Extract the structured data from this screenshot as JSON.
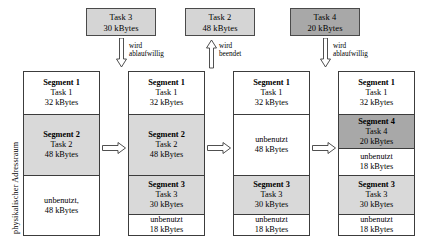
{
  "diagram": {
    "axis_caption": "physikalischer Adressraum",
    "events": [
      {
        "name": "task3-arrives",
        "line1": "Task 3",
        "line2": "30 kBytes",
        "fill": "light",
        "arrow_direction": "down",
        "arrow_label_line1": "wird",
        "arrow_label_line2": "ablaufwillig"
      },
      {
        "name": "task2-terminates",
        "line1": "Task 2",
        "line2": "48 kBytes",
        "fill": "light",
        "arrow_direction": "up",
        "arrow_label_line1": "wird",
        "arrow_label_line2": "beendet"
      },
      {
        "name": "task4-arrives",
        "line1": "Task 4",
        "line2": "20 kBytes",
        "fill": "dark",
        "arrow_direction": "down",
        "arrow_label_line1": "wird",
        "arrow_label_line2": "ablaufwillig"
      }
    ],
    "transition_arrows": [
      {
        "name": "transition-1-to-2",
        "direction": "right"
      },
      {
        "name": "transition-2-to-3",
        "direction": "right"
      },
      {
        "name": "transition-3-to-4",
        "direction": "right"
      }
    ],
    "columns": [
      {
        "name": "memory-state-1",
        "blocks": [
          {
            "title": "Segment 1",
            "line1": "Task 1",
            "line2": "32 kBytes",
            "fill": "white",
            "size_kb": 32
          },
          {
            "title": "Segment 2",
            "line1": "Task 2",
            "line2": "48 kBytes",
            "fill": "light",
            "size_kb": 48
          },
          {
            "title": "",
            "line1": "unbenutzt,",
            "line2": "48 kBytes",
            "fill": "white",
            "size_kb": 48
          }
        ]
      },
      {
        "name": "memory-state-2",
        "blocks": [
          {
            "title": "Segment 1",
            "line1": "Task 1",
            "line2": "32 kBytes",
            "fill": "white",
            "size_kb": 32
          },
          {
            "title": "Segment 2",
            "line1": "Task 2",
            "line2": "48 kBytes",
            "fill": "light",
            "size_kb": 48
          },
          {
            "title": "Segment 3",
            "line1": "Task 3",
            "line2": "30 kBytes",
            "fill": "light",
            "size_kb": 30
          },
          {
            "title": "",
            "line1": "unbenutzt",
            "line2": "18 kBytes",
            "fill": "white",
            "size_kb": 18
          }
        ]
      },
      {
        "name": "memory-state-3",
        "blocks": [
          {
            "title": "Segment 1",
            "line1": "Task 1",
            "line2": "32 kBytes",
            "fill": "white",
            "size_kb": 32
          },
          {
            "title": "",
            "line1": "unbenutzt",
            "line2": "48 kBytes",
            "fill": "white",
            "size_kb": 48
          },
          {
            "title": "Segment 3",
            "line1": "Task 3",
            "line2": "30 kBytes",
            "fill": "light",
            "size_kb": 30
          },
          {
            "title": "",
            "line1": "unbenutzt",
            "line2": "18 kBytes",
            "fill": "white",
            "size_kb": 18
          }
        ]
      },
      {
        "name": "memory-state-4",
        "blocks": [
          {
            "title": "Segment 1",
            "line1": "Task 1",
            "line2": "32 kBytes",
            "fill": "white",
            "size_kb": 32
          },
          {
            "title": "Segment 4",
            "line1": "Task 4",
            "line2": "20 kBytes",
            "fill": "dark",
            "size_kb": 20
          },
          {
            "title": "",
            "line1": "unbenutzt",
            "line2": "18 kBytes",
            "fill": "white",
            "size_kb": 18
          },
          {
            "title": "Segment 3",
            "line1": "Task 3",
            "line2": "30 kBytes",
            "fill": "light",
            "size_kb": 30
          },
          {
            "title": "",
            "line1": "unbenutzt",
            "line2": "18 kBytes",
            "fill": "white",
            "size_kb": 18
          }
        ]
      }
    ]
  }
}
